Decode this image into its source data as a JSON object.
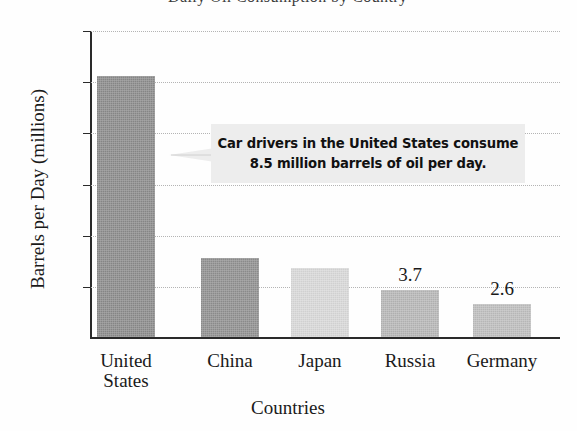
{
  "title_sliver": "Daily Oil Consumption by Country",
  "chart_data": {
    "type": "bar",
    "title": "Daily Oil Consumption by Country",
    "xlabel": "Countries",
    "ylabel": "Barrels per Day (millions)",
    "ylim": [
      0,
      24
    ],
    "ytick_labels": [
      "24",
      "20",
      "16",
      "12",
      "8",
      "4"
    ],
    "ytick_values": [
      24,
      20,
      16,
      12,
      8,
      4
    ],
    "grid": true,
    "grid_style": "dotted horizontal",
    "legend": "none",
    "categories": [
      "United States",
      "China",
      "Japan",
      "Russia",
      "Germany"
    ],
    "values": [
      20.4,
      6.2,
      5.4,
      3.7,
      2.6
    ],
    "bar_colors": [
      "#8a8a8a",
      "#8f8f8f",
      "#d8d8d8",
      "#b6b6b6",
      "#bdbdbd"
    ],
    "data_labels": [
      "",
      "",
      "",
      "3.7",
      "2.6"
    ],
    "annotation": {
      "line1": "Car drivers in the United States consume",
      "line2": "8.5 million barrels of oil per day.",
      "points_to": "United States",
      "background": "#ededed"
    }
  },
  "category_lines": [
    [
      "United",
      "States"
    ],
    [
      "China",
      ""
    ],
    [
      "Japan",
      ""
    ],
    [
      "Russia",
      ""
    ],
    [
      "Germany",
      ""
    ]
  ]
}
